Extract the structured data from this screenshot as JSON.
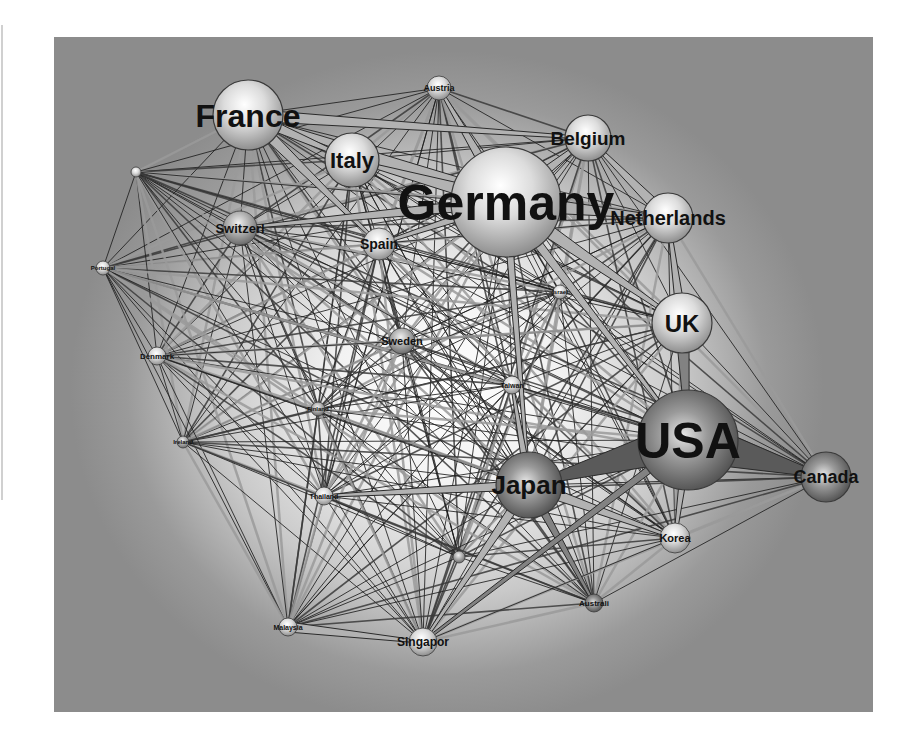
{
  "figure": {
    "type": "network-diagram",
    "colors": {
      "background_outer": "#8c8c8c",
      "background_center": "#ffffff",
      "node_light": "#f4f4f4",
      "node_dark": "#6e6e6e",
      "edge_dark": "#1e1e1e",
      "edge_light": "#9a9a9a",
      "label": "#111111"
    }
  },
  "nodes": [
    {
      "id": "France",
      "label": "France",
      "x": 194,
      "y": 78,
      "r": 35,
      "font": 32,
      "shade": "light"
    },
    {
      "id": "Austria",
      "label": "Austria",
      "x": 385,
      "y": 51,
      "r": 12,
      "font": 9,
      "shade": "light"
    },
    {
      "id": "Belgium",
      "label": "Belgium",
      "x": 534,
      "y": 101,
      "r": 23,
      "font": 19,
      "shade": "light"
    },
    {
      "id": "Italy",
      "label": "Italy",
      "x": 298,
      "y": 123,
      "r": 27,
      "font": 22,
      "shade": "light"
    },
    {
      "id": "Germany",
      "label": "Germany",
      "x": 452,
      "y": 165,
      "r": 55,
      "font": 50,
      "shade": "light"
    },
    {
      "id": "Netherlands",
      "label": "Netherlands",
      "x": 614,
      "y": 181,
      "r": 25,
      "font": 20,
      "shade": "light"
    },
    {
      "id": "Switzerl",
      "label": "Switzerl",
      "x": 186,
      "y": 191,
      "r": 17,
      "font": 13,
      "shade": "mid"
    },
    {
      "id": "Spain",
      "label": "Spain",
      "x": 325,
      "y": 207,
      "r": 16,
      "font": 14,
      "shade": "light"
    },
    {
      "id": "Unlabeled1",
      "label": "",
      "x": 82,
      "y": 135,
      "r": 5,
      "font": 6,
      "shade": "light"
    },
    {
      "id": "Portugal",
      "label": "Portugal",
      "x": 49,
      "y": 231,
      "r": 7,
      "font": 6,
      "shade": "light"
    },
    {
      "id": "Israel",
      "label": "Israel",
      "x": 506,
      "y": 255,
      "r": 7,
      "font": 6,
      "shade": "light"
    },
    {
      "id": "UK",
      "label": "UK",
      "x": 628,
      "y": 286,
      "r": 30,
      "font": 24,
      "shade": "light"
    },
    {
      "id": "Sweden",
      "label": "Sweden",
      "x": 348,
      "y": 304,
      "r": 13,
      "font": 11,
      "shade": "mid"
    },
    {
      "id": "Denmark",
      "label": "Denmark",
      "x": 103,
      "y": 319,
      "r": 9,
      "font": 8,
      "shade": "light"
    },
    {
      "id": "Taiwan",
      "label": "Taiwan",
      "x": 458,
      "y": 348,
      "r": 9,
      "font": 7,
      "shade": "light"
    },
    {
      "id": "Finland",
      "label": "Finland",
      "x": 264,
      "y": 372,
      "r": 7,
      "font": 6,
      "shade": "mid"
    },
    {
      "id": "Ireland",
      "label": "Ireland",
      "x": 129,
      "y": 405,
      "r": 6,
      "font": 6,
      "shade": "mid"
    },
    {
      "id": "USA",
      "label": "USA",
      "x": 634,
      "y": 403,
      "r": 50,
      "font": 50,
      "shade": "dark"
    },
    {
      "id": "Japan",
      "label": "Japan",
      "x": 475,
      "y": 448,
      "r": 33,
      "font": 26,
      "shade": "dark"
    },
    {
      "id": "Canada",
      "label": "Canada",
      "x": 772,
      "y": 440,
      "r": 25,
      "font": 18,
      "shade": "dark"
    },
    {
      "id": "Thailand",
      "label": "Thailand",
      "x": 270,
      "y": 459,
      "r": 9,
      "font": 7,
      "shade": "light"
    },
    {
      "id": "Korea",
      "label": "Korea",
      "x": 621,
      "y": 501,
      "r": 15,
      "font": 11,
      "shade": "light"
    },
    {
      "id": "Unlabeled2",
      "label": "",
      "x": 405,
      "y": 520,
      "r": 6,
      "font": 6,
      "shade": "mid"
    },
    {
      "id": "Australi",
      "label": "Australi",
      "x": 540,
      "y": 566,
      "r": 9,
      "font": 8,
      "shade": "dark"
    },
    {
      "id": "Malaysia",
      "label": "Malaysia",
      "x": 234,
      "y": 590,
      "r": 9,
      "font": 7,
      "shade": "light"
    },
    {
      "id": "Singapor",
      "label": "Singapor",
      "x": 369,
      "y": 605,
      "r": 14,
      "font": 12,
      "shade": "light"
    }
  ],
  "heavy_edges": [
    {
      "from": "USA",
      "to": "Canada",
      "width": 44,
      "tone": "dark"
    },
    {
      "from": "USA",
      "to": "Japan",
      "width": 40,
      "tone": "dark"
    },
    {
      "from": "Germany",
      "to": "France",
      "width": 20,
      "tone": "light"
    },
    {
      "from": "Germany",
      "to": "Netherlands",
      "width": 18,
      "tone": "light"
    },
    {
      "from": "Germany",
      "to": "Italy",
      "width": 16,
      "tone": "light"
    },
    {
      "from": "Germany",
      "to": "UK",
      "width": 16,
      "tone": "light"
    },
    {
      "from": "Germany",
      "to": "Belgium",
      "width": 14,
      "tone": "light"
    },
    {
      "from": "Germany",
      "to": "Austria",
      "width": 12,
      "tone": "light"
    },
    {
      "from": "France",
      "to": "Italy",
      "width": 12,
      "tone": "light"
    },
    {
      "from": "France",
      "to": "Belgium",
      "width": 12,
      "tone": "light"
    },
    {
      "from": "France",
      "to": "Spain",
      "width": 12,
      "tone": "light"
    },
    {
      "from": "Germany",
      "to": "Switzerl",
      "width": 12,
      "tone": "light"
    },
    {
      "from": "Germany",
      "to": "Spain",
      "width": 10,
      "tone": "light"
    },
    {
      "from": "Netherlands",
      "to": "Belgium",
      "width": 12,
      "tone": "light"
    },
    {
      "from": "UK",
      "to": "USA",
      "width": 14,
      "tone": "mid"
    },
    {
      "from": "Japan",
      "to": "Korea",
      "width": 12,
      "tone": "light"
    },
    {
      "from": "Japan",
      "to": "Thailand",
      "width": 10,
      "tone": "light"
    },
    {
      "from": "Japan",
      "to": "Singapor",
      "width": 10,
      "tone": "light"
    },
    {
      "from": "Japan",
      "to": "Australi",
      "width": 9,
      "tone": "mid"
    },
    {
      "from": "Malaysia",
      "to": "Singapor",
      "width": 10,
      "tone": "light"
    },
    {
      "from": "USA",
      "to": "Korea",
      "width": 10,
      "tone": "light"
    },
    {
      "from": "Germany",
      "to": "Japan",
      "width": 8,
      "tone": "light"
    },
    {
      "from": "Germany",
      "to": "USA",
      "width": 10,
      "tone": "light"
    },
    {
      "from": "UK",
      "to": "Netherlands",
      "width": 10,
      "tone": "light"
    },
    {
      "from": "USA",
      "to": "Singapor",
      "width": 8,
      "tone": "mid"
    },
    {
      "from": "Japan",
      "to": "Taiwan",
      "width": 8,
      "tone": "light"
    }
  ]
}
